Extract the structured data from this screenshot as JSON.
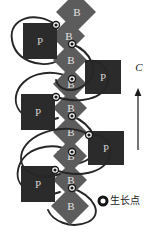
{
  "figure": {
    "title": "",
    "background_color": "#ffffff",
    "width": 157,
    "height": 242
  },
  "colors": {
    "p_unit_fill": "#2b2b2b",
    "b_unit_fill": "#5c5c5c",
    "thread_stroke": "#262626",
    "node_ring_outer": "#1a1a1a",
    "node_ring_inner": "#ffffff",
    "node_core": "#1a1a1a",
    "label_text": "#1a1a1a",
    "unit_label_text": "#d8d8d8"
  },
  "chain": {
    "b_units": [
      {
        "id": "b1",
        "label": "B",
        "cx": 76,
        "cy": 12,
        "r": 20
      },
      {
        "id": "b2",
        "label": "B",
        "cx": 68,
        "cy": 36,
        "r": 17
      },
      {
        "id": "b3",
        "label": "B",
        "cx": 70,
        "cy": 60,
        "r": 17
      },
      {
        "id": "b4",
        "label": "B",
        "cx": 70,
        "cy": 84,
        "r": 17
      },
      {
        "id": "b5",
        "label": "B",
        "cx": 70,
        "cy": 108,
        "r": 17
      },
      {
        "id": "b6",
        "label": "B",
        "cx": 70,
        "cy": 132,
        "r": 17
      },
      {
        "id": "b7",
        "label": "B",
        "cx": 70,
        "cy": 156,
        "r": 17
      },
      {
        "id": "b8",
        "label": "B",
        "cx": 70,
        "cy": 180,
        "r": 17
      },
      {
        "id": "b9",
        "label": "B",
        "cx": 70,
        "cy": 206,
        "r": 19
      }
    ],
    "p_units": [
      {
        "id": "p1",
        "label": "P",
        "side": "left",
        "x": 23,
        "y": 23,
        "w": 34,
        "h": 36
      },
      {
        "id": "p2",
        "label": "P",
        "side": "right",
        "x": 85,
        "y": 60,
        "w": 36,
        "h": 34
      },
      {
        "id": "p3",
        "label": "P",
        "side": "left",
        "x": 21,
        "y": 94,
        "w": 34,
        "h": 36
      },
      {
        "id": "p4",
        "label": "P",
        "side": "right",
        "x": 88,
        "y": 131,
        "w": 36,
        "h": 34
      },
      {
        "id": "p5",
        "label": "P",
        "side": "left",
        "x": 21,
        "y": 166,
        "w": 34,
        "h": 36
      }
    ],
    "growth_nodes": [
      {
        "id": "n1",
        "cx": 56,
        "cy": 25
      },
      {
        "id": "n2",
        "cx": 72,
        "cy": 44
      },
      {
        "id": "n3",
        "cx": 72,
        "cy": 79
      },
      {
        "id": "n4",
        "cx": 56,
        "cy": 97
      },
      {
        "id": "n5",
        "cx": 72,
        "cy": 116
      },
      {
        "id": "n6",
        "cx": 89,
        "cy": 135
      },
      {
        "id": "n7",
        "cx": 72,
        "cy": 152
      },
      {
        "id": "n8",
        "cx": 55,
        "cy": 170
      },
      {
        "id": "n9",
        "cx": 72,
        "cy": 188
      }
    ],
    "threads": [
      "M 56 25 C 36 10 8 18 12 40 C 15 60 40 70 60 60",
      "M 72 44 C 92 52 100 72 86 84 C 70 96 58 88 56 80",
      "M 72 79 C 52 66 20 74 16 96 C 13 116 38 126 58 118",
      "M 56 97 C 78 104 104 100 108 82 C 110 66 96 58 86 62",
      "M 72 116 C 92 124 104 146 90 158 C 74 170 60 160 58 152",
      "M 89 135 C 70 122 30 130 22 152 C 16 172 40 182 60 174",
      "M 72 152 C 52 140 22 148 18 170 C 14 190 40 200 60 192",
      "M 55 170 C 78 178 104 174 110 156 C 113 140 99 132 89 136",
      "M 72 188 C 94 196 104 214 88 222 C 70 230 52 220 48 210"
    ]
  },
  "axis": {
    "label": "C",
    "arrow": {
      "x": 138,
      "y_top": 88,
      "y_bottom": 150
    },
    "label_x": 139,
    "label_y": 68
  },
  "legend": {
    "marker_cx": 103,
    "marker_cy": 201,
    "marker_r": 4,
    "text": "生长点",
    "text_x": 110,
    "text_y": 201,
    "marker_name": "growth-point-marker"
  }
}
